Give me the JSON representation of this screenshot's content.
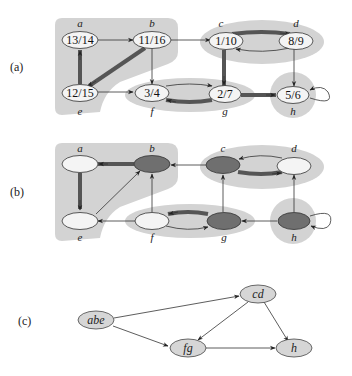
{
  "panels": [
    {
      "id": "a",
      "label": "(a)"
    },
    {
      "id": "b",
      "label": "(b)"
    },
    {
      "id": "c",
      "label": "(c)"
    }
  ],
  "panel_a": {
    "nodes": [
      {
        "name": "a",
        "times": "13/14"
      },
      {
        "name": "b",
        "times": "11/16"
      },
      {
        "name": "c",
        "times": "1/10"
      },
      {
        "name": "d",
        "times": "8/9"
      },
      {
        "name": "e",
        "times": "12/15"
      },
      {
        "name": "f",
        "times": "3/4"
      },
      {
        "name": "g",
        "times": "2/7"
      },
      {
        "name": "h",
        "times": "5/6"
      }
    ],
    "edges": [
      [
        "a",
        "b"
      ],
      [
        "b",
        "c"
      ],
      [
        "b",
        "e"
      ],
      [
        "b",
        "f"
      ],
      [
        "c",
        "d"
      ],
      [
        "c",
        "g"
      ],
      [
        "d",
        "c"
      ],
      [
        "d",
        "h"
      ],
      [
        "e",
        "a"
      ],
      [
        "e",
        "f"
      ],
      [
        "f",
        "g"
      ],
      [
        "g",
        "f"
      ],
      [
        "g",
        "h"
      ],
      [
        "h",
        "h"
      ]
    ],
    "tree_edges": [
      [
        "b",
        "e"
      ],
      [
        "c",
        "d"
      ],
      [
        "c",
        "g"
      ],
      [
        "e",
        "a"
      ],
      [
        "g",
        "f"
      ],
      [
        "g",
        "h"
      ]
    ],
    "components": [
      [
        "a",
        "b",
        "e"
      ],
      [
        "c",
        "d"
      ],
      [
        "f",
        "g"
      ],
      [
        "h"
      ]
    ]
  },
  "panel_b": {
    "description": "Transpose graph G^T with component roots shaded dark",
    "nodes": [
      {
        "name": "a",
        "shade": "light"
      },
      {
        "name": "b",
        "shade": "dark"
      },
      {
        "name": "c",
        "shade": "dark"
      },
      {
        "name": "d",
        "shade": "light"
      },
      {
        "name": "e",
        "shade": "light"
      },
      {
        "name": "f",
        "shade": "light"
      },
      {
        "name": "g",
        "shade": "dark"
      },
      {
        "name": "h",
        "shade": "dark"
      }
    ]
  },
  "panel_c": {
    "description": "Component graph",
    "nodes": [
      "abe",
      "cd",
      "fg",
      "h"
    ],
    "edges": [
      [
        "abe",
        "cd"
      ],
      [
        "abe",
        "fg"
      ],
      [
        "cd",
        "fg"
      ],
      [
        "cd",
        "h"
      ],
      [
        "fg",
        "h"
      ]
    ]
  }
}
